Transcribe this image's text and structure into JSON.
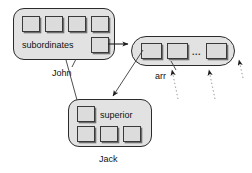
{
  "diagram": {
    "background_color": "#ffffff",
    "object_fill": "#e2e2e2",
    "cell_fill": "#dcdcdc",
    "stroke_color": "#2b2b2b"
  },
  "objects": {
    "john": {
      "caption": "John",
      "field_label": "subordinates",
      "top_row_cell_count": 4,
      "pointer_cell_count": 1
    },
    "arr": {
      "caption": "arr",
      "ellipsis": "...",
      "cell_count": 3
    },
    "jack": {
      "caption": "Jack",
      "field_label": "superior",
      "top_row_cell_count": 1,
      "bottom_row_cell_count": 3
    }
  },
  "connectors": [
    {
      "name": "john-to-arr",
      "style": "solid",
      "arrow": true
    },
    {
      "name": "arr-first-cell-to-jack",
      "style": "solid",
      "arrow": true
    },
    {
      "name": "john-caption-leader",
      "style": "solid",
      "arrow": false
    },
    {
      "name": "jack-superior-to-john",
      "style": "solid",
      "arrow": false
    },
    {
      "name": "arr-caption-leader",
      "style": "solid",
      "arrow": false
    },
    {
      "name": "arr-cell2-dangling",
      "style": "dotted",
      "arrow": true
    },
    {
      "name": "arr-cell3-dangling",
      "style": "dotted",
      "arrow": true
    },
    {
      "name": "arr-right-dangling",
      "style": "dotted",
      "arrow": true
    }
  ]
}
